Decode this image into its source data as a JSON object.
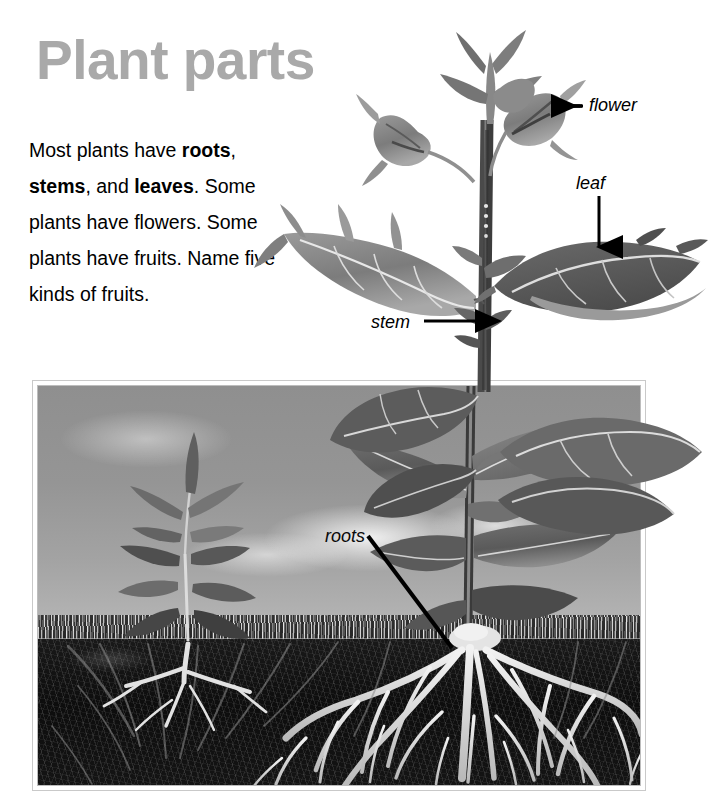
{
  "page": {
    "title": "Plant parts",
    "title_color": "#a9a9a9",
    "background_color": "#ffffff",
    "paragraph": {
      "segments": [
        {
          "text": "Most plants have ",
          "bold": false
        },
        {
          "text": "roots",
          "bold": true
        },
        {
          "text": ", ",
          "bold": false
        },
        {
          "text": "stems",
          "bold": true
        },
        {
          "text": ", and ",
          "bold": false
        },
        {
          "text": "leaves",
          "bold": true
        },
        {
          "text": ". Some plants have flowers. Some plants have fruits. Name five kinds of fruits.",
          "bold": false
        }
      ],
      "plain_text": "Most plants have roots, stems, and leaves. Some plants have flowers. Some plants have fruits. Name five kinds of fruits.",
      "bold_words": [
        "roots",
        "stems",
        "leaves"
      ]
    }
  },
  "annotations": [
    {
      "label": "flower",
      "arrow": "left-arrow",
      "points_to": "flower-bud"
    },
    {
      "label": "leaf",
      "arrow": "down-arrow",
      "points_to": "upper-right-leaf"
    },
    {
      "label": "stem",
      "arrow": "right-arrow",
      "points_to": "main-stem"
    },
    {
      "label": "roots",
      "arrow": "diagonal-line",
      "points_to": "root-crown"
    }
  ],
  "labels": {
    "flower": "flower",
    "leaf": "leaf",
    "stem": "stem",
    "roots": "roots"
  },
  "figure": {
    "caption": "",
    "photo_colors": {
      "sky": "#9a9a9a",
      "grass": "#6a6a6a",
      "soil": "#121212",
      "roots": "#e8e8e8",
      "frame": "#bdbdbd"
    }
  }
}
